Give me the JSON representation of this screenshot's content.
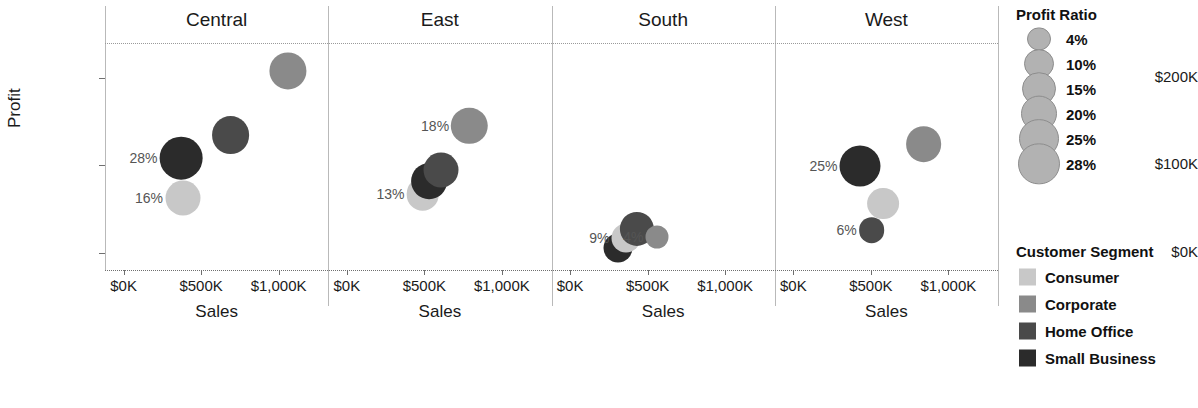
{
  "chart_data": {
    "type": "scatter",
    "title": "",
    "xlabel": "Sales",
    "ylabel": "Profit",
    "xlim": [
      -120000,
      1320000
    ],
    "ylim": [
      -20000,
      240000
    ],
    "grid": false,
    "facet_field": "Region",
    "size_field": "Profit Ratio",
    "color_field": "Customer Segment",
    "x_ticks": [
      "$0K",
      "$500K",
      "$1,000K"
    ],
    "x_tick_values": [
      0,
      500000,
      1000000
    ],
    "y_ticks": [
      "$0K",
      "$100K",
      "$200K"
    ],
    "y_tick_values": [
      0,
      100000,
      200000
    ],
    "panels": [
      {
        "name": "Central",
        "points": [
          {
            "segment": "Consumer",
            "sales": 380000,
            "profit": 63000,
            "ratio": 16,
            "label": "16%"
          },
          {
            "segment": "Small Business",
            "sales": 370000,
            "profit": 108000,
            "ratio": 28,
            "label": "28%"
          },
          {
            "segment": "Home Office",
            "sales": 690000,
            "profit": 135000,
            "ratio": 20,
            "label": ""
          },
          {
            "segment": "Corporate",
            "sales": 1060000,
            "profit": 208000,
            "ratio": 19,
            "label": ""
          }
        ]
      },
      {
        "name": "East",
        "points": [
          {
            "segment": "Consumer",
            "sales": 490000,
            "profit": 67000,
            "ratio": 13,
            "label": "13%"
          },
          {
            "segment": "Small Business",
            "sales": 530000,
            "profit": 82000,
            "ratio": 17,
            "label": ""
          },
          {
            "segment": "Home Office",
            "sales": 605000,
            "profit": 94000,
            "ratio": 16,
            "label": ""
          },
          {
            "segment": "Corporate",
            "sales": 790000,
            "profit": 145000,
            "ratio": 18,
            "label": "18%"
          }
        ]
      },
      {
        "name": "South",
        "points": [
          {
            "segment": "Small Business",
            "sales": 310000,
            "profit": 5000,
            "ratio": 9,
            "label": ""
          },
          {
            "segment": "Consumer",
            "sales": 360000,
            "profit": 17000,
            "ratio": 9,
            "label": "9%"
          },
          {
            "segment": "Home Office",
            "sales": 430000,
            "profit": 27000,
            "ratio": 15,
            "label": ""
          },
          {
            "segment": "Corporate",
            "sales": 560000,
            "profit": 18000,
            "ratio": 4,
            "label": "4%"
          }
        ]
      },
      {
        "name": "West",
        "points": [
          {
            "segment": "Small Business",
            "sales": 430000,
            "profit": 99000,
            "ratio": 25,
            "label": "25%"
          },
          {
            "segment": "Consumer",
            "sales": 580000,
            "profit": 56000,
            "ratio": 12,
            "label": ""
          },
          {
            "segment": "Home Office",
            "sales": 505000,
            "profit": 26000,
            "ratio": 6,
            "label": "6%"
          },
          {
            "segment": "Corporate",
            "sales": 840000,
            "profit": 124000,
            "ratio": 17,
            "label": ""
          }
        ]
      }
    ],
    "legends": {
      "size": {
        "title": "Profit Ratio",
        "entries": [
          {
            "label": "4%",
            "value": 4
          },
          {
            "label": "10%",
            "value": 10
          },
          {
            "label": "15%",
            "value": 15
          },
          {
            "label": "20%",
            "value": 20
          },
          {
            "label": "25%",
            "value": 25
          },
          {
            "label": "28%",
            "value": 28
          }
        ]
      },
      "color": {
        "title": "Customer Segment",
        "entries": [
          {
            "label": "Consumer",
            "color": "#c8c8c8"
          },
          {
            "label": "Corporate",
            "color": "#8a8a8a"
          },
          {
            "label": "Home Office",
            "color": "#4a4a4a"
          },
          {
            "label": "Small Business",
            "color": "#2b2b2b"
          }
        ]
      }
    }
  }
}
